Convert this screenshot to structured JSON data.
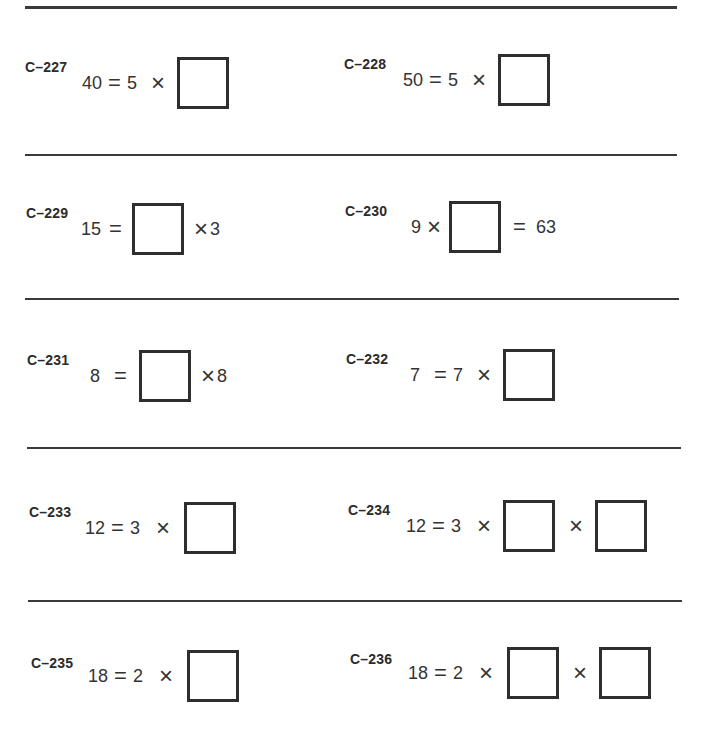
{
  "worksheet": {
    "problems": [
      {
        "id": "C–227",
        "tokens": [
          "40",
          "=",
          "5",
          "×",
          "□"
        ]
      },
      {
        "id": "C–228",
        "tokens": [
          "50",
          "=",
          "5",
          "×",
          "□"
        ]
      },
      {
        "id": "C–229",
        "tokens": [
          "15",
          "=",
          "□",
          "×",
          "3"
        ]
      },
      {
        "id": "C–230",
        "tokens": [
          "9",
          "×",
          "□",
          "=",
          "63"
        ]
      },
      {
        "id": "C–231",
        "tokens": [
          "8",
          "=",
          "□",
          "×",
          "8"
        ]
      },
      {
        "id": "C–232",
        "tokens": [
          "7",
          "=",
          "7",
          "×",
          "□"
        ]
      },
      {
        "id": "C–233",
        "tokens": [
          "12",
          "=",
          "3",
          "×",
          "□"
        ]
      },
      {
        "id": "C–234",
        "tokens": [
          "12",
          "=",
          "3",
          "×",
          "□",
          "×",
          "□"
        ]
      },
      {
        "id": "C–235",
        "tokens": [
          "18",
          "=",
          "2",
          "×",
          "□"
        ]
      },
      {
        "id": "C–236",
        "tokens": [
          "18",
          "=",
          "2",
          "×",
          "□",
          "×",
          "□"
        ]
      }
    ],
    "symbols": {
      "equals": "=",
      "times": "×"
    }
  }
}
